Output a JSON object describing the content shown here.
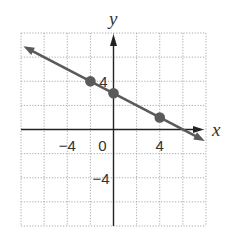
{
  "chart_data": {
    "type": "line",
    "title": "",
    "xlabel": "x",
    "ylabel": "y",
    "xlim": [
      -8,
      8
    ],
    "ylim": [
      -8,
      8
    ],
    "grid": true,
    "grid_step": 2,
    "x_tick_labels": [
      {
        "value": -4,
        "label": "−4"
      },
      {
        "value": 0,
        "label": "0"
      },
      {
        "value": 4,
        "label": "4"
      }
    ],
    "y_tick_labels": [
      {
        "value": 4,
        "label": "4"
      },
      {
        "value": -4,
        "label": "−4"
      }
    ],
    "series": [
      {
        "name": "line",
        "equation": "y = -x/2 + 3",
        "slope": -0.5,
        "intercept": 3,
        "x_range": [
          -7.8,
          7.9
        ],
        "arrows_both_ends": true
      }
    ],
    "points": [
      {
        "x": -2,
        "y": 4
      },
      {
        "x": 0,
        "y": 3
      },
      {
        "x": 4,
        "y": 1
      }
    ],
    "colors": {
      "line": "#5a5a5a",
      "points": "#5a5a5a",
      "axes": "#222222",
      "grid": "#a8a8a8"
    }
  }
}
